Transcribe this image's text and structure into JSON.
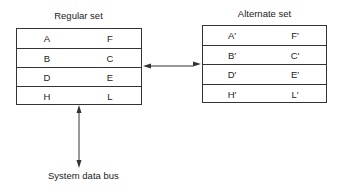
{
  "diagram": {
    "regular_set": {
      "title": "Regular set",
      "rows": [
        {
          "left": "A",
          "right": "F"
        },
        {
          "left": "B",
          "right": "C"
        },
        {
          "left": "D",
          "right": "E"
        },
        {
          "left": "H",
          "right": "L"
        }
      ]
    },
    "alternate_set": {
      "title": "Alternate set",
      "rows": [
        {
          "left": "A′",
          "right": "F′"
        },
        {
          "left": "B′",
          "right": "C′"
        },
        {
          "left": "D′",
          "right": "E′"
        },
        {
          "left": "H′",
          "right": "L′"
        }
      ]
    },
    "bus_label": "System data bus",
    "connections": [
      {
        "from": "regular_set",
        "to": "alternate_set",
        "type": "bidirectional-arrow"
      },
      {
        "from": "regular_set",
        "to": "system_data_bus",
        "type": "bidirectional-arrow"
      }
    ],
    "colors": {
      "line": "#333333",
      "text": "#222222",
      "background": "#ffffff"
    }
  }
}
